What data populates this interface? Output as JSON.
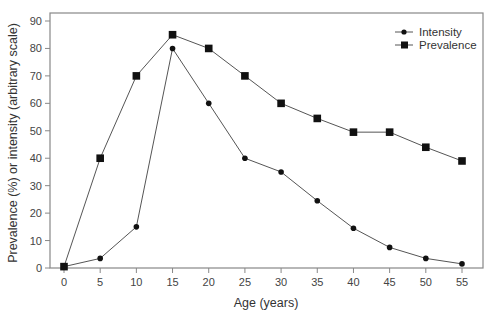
{
  "chart_data": {
    "type": "line",
    "title": "",
    "xlabel": "Age (years)",
    "ylabel": "Prevalence (%) or intensity (arbitrary scale)",
    "x": [
      0,
      5,
      10,
      15,
      20,
      25,
      30,
      35,
      40,
      45,
      50,
      55
    ],
    "x_ticks": [
      "0",
      "5",
      "10",
      "15",
      "20",
      "25",
      "30",
      "35",
      "40",
      "45",
      "50",
      "55"
    ],
    "y_ticks": [
      "0",
      "10",
      "20",
      "30",
      "40",
      "50",
      "60",
      "70",
      "80",
      "90"
    ],
    "xlim": [
      0,
      55
    ],
    "ylim": [
      0,
      90
    ],
    "grid": false,
    "legend_position": "upper right",
    "series": [
      {
        "name": "Intensity",
        "marker": "circle",
        "color": "#111111",
        "values": [
          0.5,
          3.5,
          15,
          80,
          60,
          40,
          35,
          24.5,
          14.5,
          7.5,
          3.5,
          1.5
        ]
      },
      {
        "name": "Prevalence",
        "marker": "square",
        "color": "#111111",
        "values": [
          0.5,
          40,
          70,
          85,
          80,
          70,
          60,
          54.5,
          49.5,
          49.5,
          44,
          39
        ]
      }
    ]
  },
  "colors": {
    "frame": "#888888",
    "line": "#555555",
    "marker": "#111111"
  }
}
